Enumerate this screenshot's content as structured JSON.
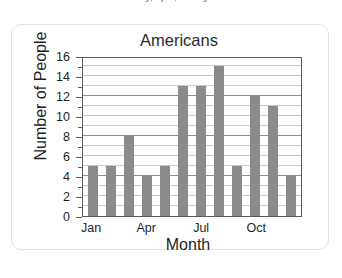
{
  "page": {
    "clipped_top_text": "of Americans that were in January, April, or July."
  },
  "card": {
    "name": "chart-card"
  },
  "chart_data": {
    "type": "bar",
    "title": "Americans",
    "xlabel": "Month",
    "ylabel": "Number of People",
    "categories": [
      "Jan",
      "Feb",
      "Mar",
      "Apr",
      "May",
      "Jun",
      "Jul",
      "Aug",
      "Sep",
      "Oct",
      "Nov",
      "Dec"
    ],
    "values": [
      5,
      5,
      8,
      4,
      5,
      13,
      13,
      15,
      5,
      12,
      11,
      4
    ],
    "visible_xtick_labels": [
      "Jan",
      "Apr",
      "Jul",
      "Oct"
    ],
    "visible_xtick_indices": [
      0,
      3,
      6,
      9
    ],
    "ytick_labels": [
      "0",
      "2",
      "4",
      "6",
      "8",
      "10",
      "12",
      "14",
      "16"
    ],
    "ytick_values": [
      0,
      2,
      4,
      6,
      8,
      10,
      12,
      14,
      16
    ],
    "ylim": [
      0,
      16
    ],
    "minor_gridline_step": 1,
    "grid": true,
    "legend": false,
    "bar_color": "#8a8a8a",
    "axis_color": "#5a5a5a",
    "grid_color": "#c9c9c9",
    "major_grid_color": "#8e8e8e"
  }
}
